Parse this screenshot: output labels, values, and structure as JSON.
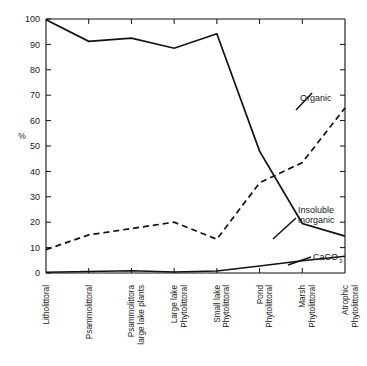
{
  "chart_data": {
    "type": "line",
    "title": "",
    "xlabel": "",
    "ylabel": "%",
    "ylim": [
      0,
      100
    ],
    "ytick_values": [
      0,
      10,
      20,
      30,
      40,
      50,
      60,
      70,
      80,
      90,
      100
    ],
    "ytick_labels": [
      "0",
      "10",
      "20",
      "30",
      "40",
      "50",
      "60",
      "70",
      "80",
      "90",
      "100"
    ],
    "grid": false,
    "legend_position": "inline-annotations",
    "categories": [
      "Litholittoral",
      "Psammolittoral",
      "Psammolittora large lake plants",
      "Large lake Phytolittoral",
      "Small lake Phytolittoral",
      "Pond Phytolittoral",
      "Marsh Phytolittoral",
      "Atrophic Phytolittoral"
    ],
    "category_lines": [
      [
        "Litholittoral"
      ],
      [
        "Psammolittoral"
      ],
      [
        "Psammolittora",
        "large lake plants"
      ],
      [
        "Large lake",
        "Phytolittoral"
      ],
      [
        "Small lake",
        "Phytolittoral"
      ],
      [
        "Pond",
        "Phytolittoral"
      ],
      [
        "Marsh",
        "Phytolittoral"
      ],
      [
        "Atrophic",
        "Phytolittoral"
      ]
    ],
    "series": [
      {
        "name": "Insoluble inorganic",
        "style": "solid",
        "values": [
          99.7,
          91.2,
          92.5,
          88.5,
          94.2,
          48.0,
          19.5,
          14.5
        ]
      },
      {
        "name": "Organic",
        "style": "dashed",
        "values": [
          9.2,
          15.0,
          17.5,
          20.0,
          13.3,
          35.5,
          43.5,
          65.0
        ]
      },
      {
        "name": "CaCO3",
        "style": "solid",
        "values": [
          0.3,
          0.6,
          0.9,
          0.4,
          0.8,
          2.8,
          4.8,
          6.6
        ]
      }
    ],
    "annotations": [
      {
        "id": "organic",
        "text": "Organic",
        "lines": [
          "Organic"
        ]
      },
      {
        "id": "insoluble-inorganic",
        "text": "Insoluble inorganic",
        "lines": [
          "Insoluble",
          "inorganic"
        ]
      },
      {
        "id": "caco3",
        "text": "CaCO3",
        "base": "CaCO",
        "sub": "3"
      }
    ]
  },
  "colors": {
    "ink": "#111111",
    "background": "#ffffff"
  }
}
